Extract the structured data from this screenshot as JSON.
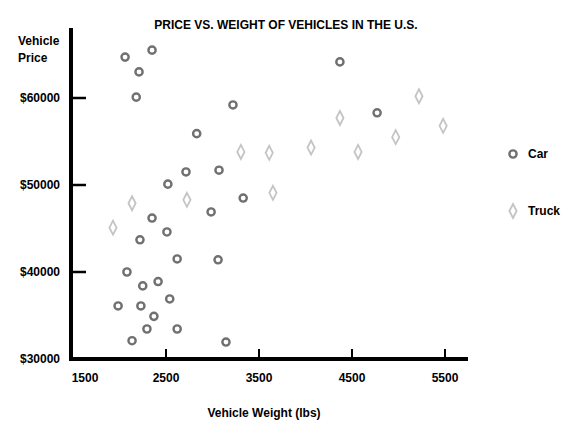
{
  "chart_data": {
    "type": "scatter",
    "title": "PRICE VS. WEIGHT OF VEHICLES IN THE U.S.",
    "xlabel": "Vehicle Weight (lbs)",
    "ylabel": "Vehicle Price",
    "ylabel_lines": [
      "Vehicle",
      "Price"
    ],
    "xlim": [
      1500,
      5750
    ],
    "ylim": [
      30000,
      67000
    ],
    "x_ticks": [
      1500,
      2500,
      3500,
      4500,
      5500
    ],
    "x_tick_labels": [
      "1500",
      "2500",
      "3500",
      "4500",
      "5500"
    ],
    "y_ticks": [
      30000,
      40000,
      50000,
      60000
    ],
    "y_tick_labels": [
      "$30000",
      "$40000",
      "$50000",
      "$60000"
    ],
    "grid": false,
    "legend_position": "right",
    "series": [
      {
        "name": "Car",
        "marker": "circle",
        "color": "#707070",
        "points": [
          [
            2060,
            64700
          ],
          [
            2350,
            65500
          ],
          [
            2210,
            63000
          ],
          [
            2180,
            60100
          ],
          [
            3220,
            59200
          ],
          [
            4370,
            64150
          ],
          [
            4770,
            58300
          ],
          [
            2830,
            55900
          ],
          [
            2715,
            51500
          ],
          [
            3070,
            51700
          ],
          [
            2520,
            50100
          ],
          [
            3330,
            48500
          ],
          [
            2985,
            46900
          ],
          [
            2350,
            46200
          ],
          [
            2510,
            44600
          ],
          [
            2220,
            43700
          ],
          [
            2620,
            41500
          ],
          [
            3060,
            41400
          ],
          [
            2080,
            40000
          ],
          [
            2415,
            38900
          ],
          [
            2250,
            38400
          ],
          [
            2540,
            36900
          ],
          [
            1985,
            36100
          ],
          [
            2230,
            36100
          ],
          [
            2370,
            34900
          ],
          [
            2295,
            33450
          ],
          [
            2620,
            33450
          ],
          [
            2135,
            32100
          ],
          [
            3145,
            31950
          ]
        ]
      },
      {
        "name": "Truck",
        "marker": "diamond",
        "color": "#c4c4c4",
        "points": [
          [
            1930,
            45100
          ],
          [
            2135,
            47900
          ],
          [
            2725,
            48300
          ],
          [
            3305,
            53800
          ],
          [
            3610,
            53700
          ],
          [
            3650,
            49100
          ],
          [
            4060,
            54300
          ],
          [
            4370,
            57700
          ],
          [
            4565,
            53800
          ],
          [
            4970,
            55500
          ],
          [
            5220,
            60200
          ],
          [
            5480,
            56800
          ]
        ]
      }
    ]
  }
}
